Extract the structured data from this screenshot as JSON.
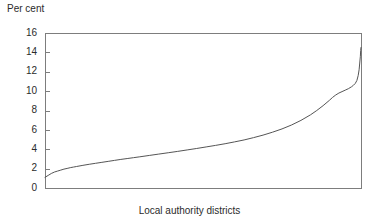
{
  "chart_data": {
    "type": "line",
    "title": "",
    "subtitle": "",
    "ylabel": "Per cent",
    "xlabel": "Local authority districts",
    "legend": [],
    "legend_position": "none",
    "grid": false,
    "ylim": [
      0,
      16
    ],
    "ytick_values": [
      0,
      2,
      4,
      6,
      8,
      10,
      12,
      14,
      16
    ],
    "ytick_labels": [
      "0",
      "2",
      "4",
      "6",
      "8",
      "10",
      "12",
      "14",
      "16"
    ],
    "xlim": [
      0,
      100
    ],
    "xtick_values": [],
    "xtick_labels": [],
    "series": [
      {
        "name": "Per cent of local authority districts (sorted ascending)",
        "x": [
          0,
          1,
          2,
          3,
          4,
          5,
          6,
          7,
          8,
          9,
          10,
          12,
          14,
          16,
          18,
          20,
          22,
          24,
          26,
          28,
          30,
          33,
          36,
          39,
          42,
          45,
          48,
          51,
          54,
          57,
          60,
          63,
          66,
          69,
          72,
          75,
          78,
          81,
          84,
          86,
          88,
          90,
          91,
          92,
          93,
          94,
          95,
          96,
          97,
          97.6,
          98.2,
          98.7,
          99.1,
          99.4,
          99.6,
          99.8,
          99.9,
          100
        ],
        "values": [
          1.1,
          1.3,
          1.5,
          1.65,
          1.75,
          1.85,
          1.95,
          2.02,
          2.1,
          2.16,
          2.22,
          2.34,
          2.45,
          2.55,
          2.65,
          2.75,
          2.85,
          2.95,
          3.04,
          3.13,
          3.22,
          3.36,
          3.5,
          3.64,
          3.78,
          3.93,
          4.08,
          4.24,
          4.4,
          4.57,
          4.76,
          4.96,
          5.2,
          5.46,
          5.76,
          6.1,
          6.5,
          6.98,
          7.55,
          8.0,
          8.5,
          9.05,
          9.35,
          9.6,
          9.8,
          9.95,
          10.1,
          10.25,
          10.45,
          10.6,
          10.8,
          11.1,
          11.6,
          12.2,
          12.9,
          13.6,
          14.2,
          14.5
        ]
      }
    ],
    "plot_area": {
      "left": 45,
      "right": 361,
      "top": 33,
      "bottom": 188
    }
  }
}
